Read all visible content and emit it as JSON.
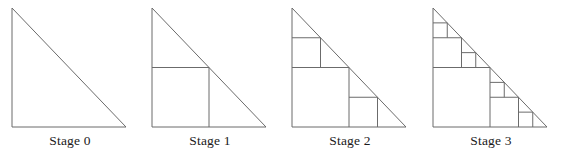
{
  "figure": {
    "background_color": "#ffffff",
    "line_color": "#6b6b6b",
    "text_color": "#1a1a1a",
    "width": 562,
    "height": 161
  },
  "panels": [
    {
      "id": "stage-0",
      "caption": "Stage 0",
      "square_count": "0",
      "x_offset": 0
    },
    {
      "id": "stage-1",
      "caption": "Stage 1",
      "square_count": "1",
      "x_offset": 140
    },
    {
      "id": "stage-2",
      "caption": "Stage 2",
      "square_count": "3",
      "x_offset": 280
    },
    {
      "id": "stage-3",
      "caption": "Stage 3",
      "square_count": "7",
      "x_offset": 421
    }
  ],
  "geometry": {
    "triangle_apex": "12,8",
    "triangle_right_angle": "12,127",
    "triangle_base_end": "126,127",
    "leg_length": 119,
    "description": "Right isosceles triangle with the right angle at lower left; each stage inscribes a square in every remaining empty sub-triangle, halving in scale each stage."
  }
}
